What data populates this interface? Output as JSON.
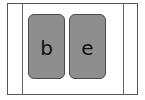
{
  "board": {
    "tiles": [
      {
        "letter": "b"
      },
      {
        "letter": "e"
      }
    ],
    "colors": {
      "tile_fill": "#8e8e8e",
      "tile_border": "#4a4a4a",
      "frame_border": "#555555",
      "letter": "#111111"
    }
  }
}
